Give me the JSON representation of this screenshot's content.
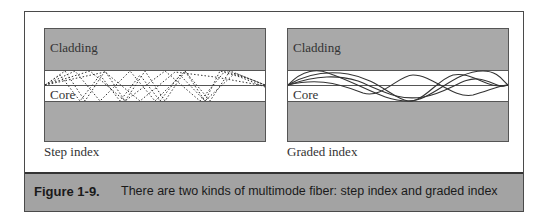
{
  "figure": {
    "number": "Figure 1-9.",
    "caption": "There are two kinds of multimode fiber: step index and graded index"
  },
  "panels": [
    {
      "id": "step-index",
      "title": "Step index",
      "cladding_label": "Cladding",
      "core_label": "Core",
      "ray_style": "dashed zig-zag reflections"
    },
    {
      "id": "graded-index",
      "title": "Graded index",
      "cladding_label": "Cladding",
      "core_label": "Core",
      "ray_style": "smooth sinusoidal curves"
    }
  ],
  "colors": {
    "cladding": "#a9a9a9",
    "core": "#ffffff",
    "caption_bar": "#a3a3a3",
    "lines": "#333333"
  }
}
